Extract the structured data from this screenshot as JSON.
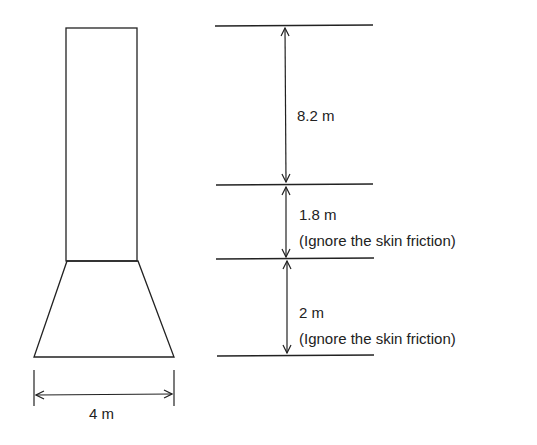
{
  "diagram": {
    "base_width_label": "4 m",
    "segments": [
      {
        "length_label": "8.2 m",
        "note": ""
      },
      {
        "length_label": "1.8 m",
        "note": "(Ignore the skin friction)"
      },
      {
        "length_label": "2 m",
        "note": "(Ignore the skin friction)"
      }
    ],
    "stroke_color": "#222222"
  }
}
